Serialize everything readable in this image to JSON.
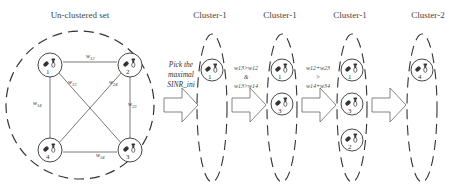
{
  "titles": {
    "unclustered": "Un-clustered set",
    "stage1": "Cluster-1",
    "stage2": "Cluster-1",
    "stage3": "Cluster-1",
    "stage4": "Cluster-2"
  },
  "edges": {
    "w12": "w12",
    "w13": "w13",
    "w24": "w24",
    "w14": "w14",
    "w23": "w23",
    "w34": "w34"
  },
  "nodes": [
    "1",
    "2",
    "3",
    "4"
  ],
  "steps": {
    "pick": [
      "Pick the",
      "maximal",
      "SINR_ini"
    ],
    "cond1": [
      "w13>w12",
      "&",
      "w13>w14"
    ],
    "cond2": [
      "w12+w23",
      ">",
      "w14+w34"
    ]
  }
}
